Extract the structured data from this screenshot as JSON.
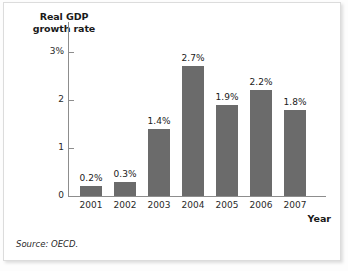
{
  "chart_data": {
    "type": "bar",
    "title": "",
    "ylabel": "Real GDP\ngrowth rate",
    "ylabel_line1": "Real GDP",
    "ylabel_line2": "growth rate",
    "xlabel": "Year",
    "categories": [
      "2001",
      "2002",
      "2003",
      "2004",
      "2005",
      "2006",
      "2007"
    ],
    "values": [
      0.2,
      0.3,
      1.4,
      2.7,
      1.9,
      2.2,
      1.8
    ],
    "value_labels": [
      "0.2%",
      "0.3%",
      "1.4%",
      "2.7%",
      "1.9%",
      "2.2%",
      "1.8%"
    ],
    "ytick_values": [
      0,
      1,
      2,
      3
    ],
    "ytick_labels": [
      "0",
      "1",
      "2",
      "3%"
    ],
    "ylim": [
      0,
      3.625
    ],
    "grid": false,
    "legend": null,
    "bar_color": "#6b6b6b",
    "axis_color": "#8d8d8d"
  },
  "source": {
    "note": "Source: OECD."
  }
}
